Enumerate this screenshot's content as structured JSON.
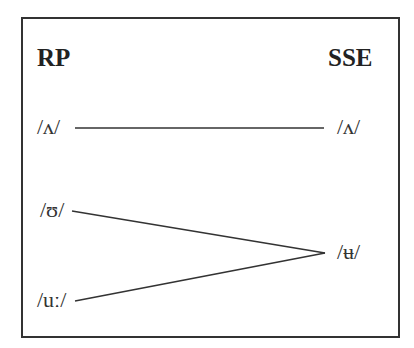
{
  "diagram": {
    "left_header": "RP",
    "right_header": "SSE",
    "rp_vowels": [
      "/ʌ/",
      "/ʊ/",
      "/uː/"
    ],
    "sse_vowels": [
      "/ʌ/",
      "/ʉ/"
    ],
    "links": [
      {
        "from": "/ʌ/",
        "to": "/ʌ/"
      },
      {
        "from": "/ʊ/",
        "to": "/ʉ/"
      },
      {
        "from": "/uː/",
        "to": "/ʉ/"
      }
    ],
    "line_color": "#333333"
  }
}
